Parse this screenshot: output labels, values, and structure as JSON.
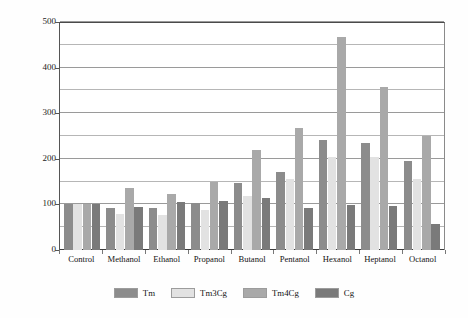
{
  "chart_data": {
    "type": "bar",
    "title": "",
    "subtitle": "",
    "xlabel": "",
    "ylabel": "Relative Activity (%)",
    "ylim": [
      0,
      500
    ],
    "yticks": [
      0,
      100,
      200,
      300,
      400,
      500
    ],
    "yticklabels": [
      "0",
      "100",
      "200",
      "300",
      "400",
      "500"
    ],
    "minor_gridlines": [
      50,
      150,
      250,
      350,
      450
    ],
    "grid": true,
    "legend_position": "bottom",
    "categories": [
      "Control",
      "Methanol",
      "Ethanol",
      "Propanol",
      "Butanol",
      "Pentanol",
      "Hexanol",
      "Heptanol",
      "Octanol"
    ],
    "series": [
      {
        "name": "Tm",
        "color": "#8c8c8c",
        "values": [
          100,
          92,
          92,
          103,
          147,
          170,
          241,
          235,
          195
        ]
      },
      {
        "name": "Tm3Cg",
        "color": "#e2e2e2",
        "values": [
          100,
          78,
          77,
          88,
          118,
          155,
          203,
          204,
          155
        ]
      },
      {
        "name": "Tm4Cg",
        "color": "#a9a9a9",
        "values": [
          100,
          135,
          123,
          150,
          220,
          267,
          468,
          357,
          250
        ]
      },
      {
        "name": "Cg",
        "color": "#7a7a7a",
        "values": [
          100,
          95,
          106,
          108,
          115,
          93,
          99,
          97,
          58
        ]
      }
    ]
  },
  "legend": {
    "entries": [
      {
        "label": "Tm"
      },
      {
        "label": "Tm3Cg"
      },
      {
        "label": "Tm4Cg"
      },
      {
        "label": "Cg"
      }
    ]
  }
}
